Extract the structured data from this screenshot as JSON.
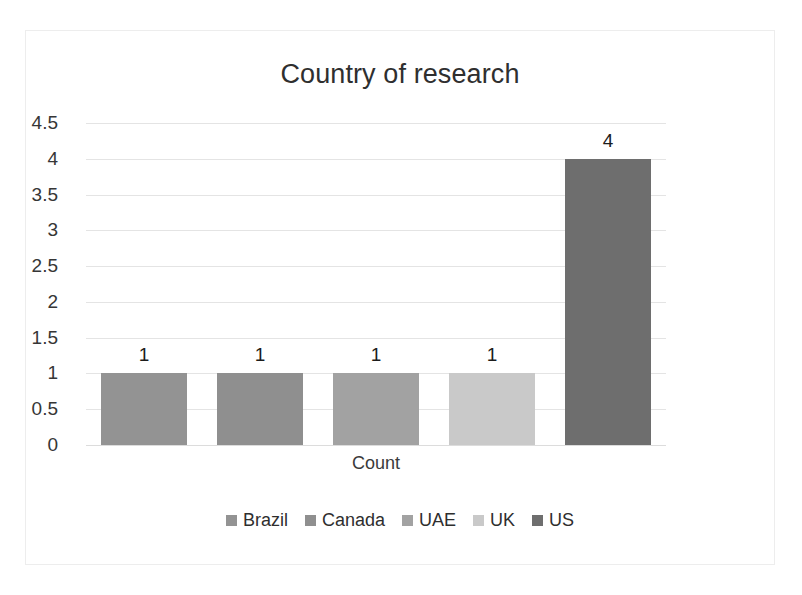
{
  "chart_data": {
    "type": "bar",
    "title": "Country of research",
    "xlabel": "Count",
    "ylabel": "",
    "categories": [
      "Brazil",
      "Canada",
      "UAE",
      "UK",
      "US"
    ],
    "values": [
      1,
      1,
      1,
      1,
      4
    ],
    "data_labels": [
      "1",
      "1",
      "1",
      "1",
      "4"
    ],
    "x_tick_labels": [
      "Count"
    ],
    "y_tick_labels": [
      "0",
      "0.5",
      "1",
      "1.5",
      "2",
      "2.5",
      "3",
      "3.5",
      "4",
      "4.5"
    ],
    "y_tick_values": [
      0,
      0.5,
      1,
      1.5,
      2,
      2.5,
      3,
      3.5,
      4,
      4.5
    ],
    "ylim": [
      0,
      4.5
    ],
    "grid": true,
    "legend_position": "bottom",
    "series_colors": [
      "#939393",
      "#8f8f8f",
      "#a2a2a2",
      "#c9c9c9",
      "#6e6e6e"
    ],
    "legend": [
      {
        "label": "Brazil",
        "color": "#939393"
      },
      {
        "label": "Canada",
        "color": "#8f8f8f"
      },
      {
        "label": "UAE",
        "color": "#a2a2a2"
      },
      {
        "label": "UK",
        "color": "#c9c9c9"
      },
      {
        "label": "US",
        "color": "#6e6e6e"
      }
    ],
    "background_color": "#ffffff",
    "gridline_color": "#e4e4e4",
    "title_color": "#2f2f2f"
  }
}
